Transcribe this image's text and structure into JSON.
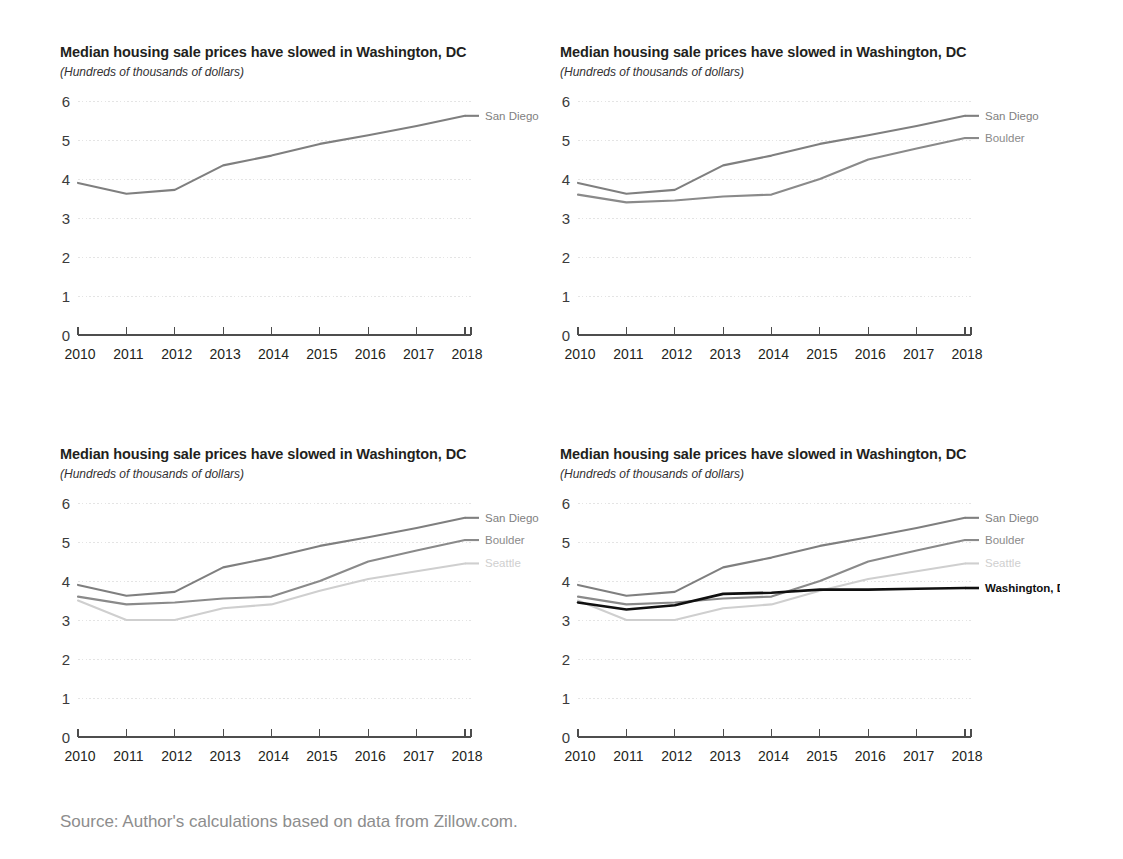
{
  "figure": {
    "source_note": "Source: Author's calculations based on data from Zillow.com."
  },
  "panels": [
    {
      "id": "panel-1",
      "title": "Median housing sale prices have slowed in Washington, DC",
      "subtitle": "(Hundreds of thousands of dollars)",
      "series_shown": [
        "San Diego"
      ]
    },
    {
      "id": "panel-2",
      "title": "Median housing sale prices have slowed in Washington, DC",
      "subtitle": "(Hundreds of thousands of dollars)",
      "series_shown": [
        "San Diego",
        "Boulder"
      ]
    },
    {
      "id": "panel-3",
      "title": "Median housing sale prices have slowed in Washington, DC",
      "subtitle": "(Hundreds of thousands of dollars)",
      "series_shown": [
        "San Diego",
        "Boulder",
        "Seattle"
      ]
    },
    {
      "id": "panel-4",
      "title": "Median housing sale prices have slowed in Washington, DC",
      "subtitle": "(Hundreds of thousands of dollars)",
      "series_shown": [
        "San Diego",
        "Boulder",
        "Seattle",
        "Washington, DC"
      ]
    }
  ],
  "colors": {
    "san_diego": "#7f7f7f",
    "boulder": "#8a8a8a",
    "seattle": "#cfcfcf",
    "washington_dc": "#101010",
    "gridline": "#e4e4e4",
    "axis": "#4d4d4d",
    "source_text": "#8d8d8d"
  },
  "chart_data": [
    {
      "type": "line",
      "title": "Median housing sale prices have slowed in Washington, DC",
      "subtitle": "(Hundreds of thousands of dollars)",
      "xlabel": "",
      "ylabel": "",
      "x": [
        2010,
        2011,
        2012,
        2013,
        2014,
        2015,
        2016,
        2017,
        2018
      ],
      "xtick_labels": [
        "2010",
        "2011",
        "2012",
        "2013",
        "2014",
        "2015",
        "2016",
        "2017",
        "2018"
      ],
      "ytick_labels": [
        "0",
        "1",
        "2",
        "3",
        "4",
        "5",
        "6"
      ],
      "ylim": [
        0,
        6
      ],
      "xlim": [
        2010,
        2018
      ],
      "grid": true,
      "legend_position": "right-end-of-line",
      "series": [
        {
          "name": "San Diego",
          "color": "#7f7f7f",
          "values": [
            3.9,
            3.62,
            3.72,
            4.35,
            4.6,
            4.9,
            5.12,
            5.36,
            5.62
          ]
        }
      ]
    },
    {
      "type": "line",
      "title": "Median housing sale prices have slowed in Washington, DC",
      "subtitle": "(Hundreds of thousands of dollars)",
      "xlabel": "",
      "ylabel": "",
      "x": [
        2010,
        2011,
        2012,
        2013,
        2014,
        2015,
        2016,
        2017,
        2018
      ],
      "xtick_labels": [
        "2010",
        "2011",
        "2012",
        "2013",
        "2014",
        "2015",
        "2016",
        "2017",
        "2018"
      ],
      "ytick_labels": [
        "0",
        "1",
        "2",
        "3",
        "4",
        "5",
        "6"
      ],
      "ylim": [
        0,
        6
      ],
      "xlim": [
        2010,
        2018
      ],
      "grid": true,
      "legend_position": "right-end-of-line",
      "series": [
        {
          "name": "San Diego",
          "color": "#7f7f7f",
          "values": [
            3.9,
            3.62,
            3.72,
            4.35,
            4.6,
            4.9,
            5.12,
            5.36,
            5.62
          ]
        },
        {
          "name": "Boulder",
          "color": "#8a8a8a",
          "values": [
            3.6,
            3.4,
            3.45,
            3.55,
            3.6,
            4.0,
            4.5,
            4.78,
            5.05
          ]
        }
      ]
    },
    {
      "type": "line",
      "title": "Median housing sale prices have slowed in Washington, DC",
      "subtitle": "(Hundreds of thousands of dollars)",
      "xlabel": "",
      "ylabel": "",
      "x": [
        2010,
        2011,
        2012,
        2013,
        2014,
        2015,
        2016,
        2017,
        2018
      ],
      "xtick_labels": [
        "2010",
        "2011",
        "2012",
        "2013",
        "2014",
        "2015",
        "2016",
        "2017",
        "2018"
      ],
      "ytick_labels": [
        "0",
        "1",
        "2",
        "3",
        "4",
        "5",
        "6"
      ],
      "ylim": [
        0,
        6
      ],
      "xlim": [
        2010,
        2018
      ],
      "grid": true,
      "legend_position": "right-end-of-line",
      "series": [
        {
          "name": "San Diego",
          "color": "#7f7f7f",
          "values": [
            3.9,
            3.62,
            3.72,
            4.35,
            4.6,
            4.9,
            5.12,
            5.36,
            5.62
          ]
        },
        {
          "name": "Boulder",
          "color": "#8a8a8a",
          "values": [
            3.6,
            3.4,
            3.45,
            3.55,
            3.6,
            4.0,
            4.5,
            4.78,
            5.05
          ]
        },
        {
          "name": "Seattle",
          "color": "#cfcfcf",
          "values": [
            3.5,
            3.0,
            3.0,
            3.3,
            3.4,
            3.75,
            4.05,
            4.25,
            4.45
          ]
        }
      ]
    },
    {
      "type": "line",
      "title": "Median housing sale prices have slowed in Washington, DC",
      "subtitle": "(Hundreds of thousands of dollars)",
      "xlabel": "",
      "ylabel": "",
      "x": [
        2010,
        2011,
        2012,
        2013,
        2014,
        2015,
        2016,
        2017,
        2018
      ],
      "xtick_labels": [
        "2010",
        "2011",
        "2012",
        "2013",
        "2014",
        "2015",
        "2016",
        "2017",
        "2018"
      ],
      "ytick_labels": [
        "0",
        "1",
        "2",
        "3",
        "4",
        "5",
        "6"
      ],
      "ylim": [
        0,
        6
      ],
      "xlim": [
        2010,
        2018
      ],
      "grid": true,
      "legend_position": "right-end-of-line",
      "series": [
        {
          "name": "San Diego",
          "color": "#7f7f7f",
          "values": [
            3.9,
            3.62,
            3.72,
            4.35,
            4.6,
            4.9,
            5.12,
            5.36,
            5.62
          ]
        },
        {
          "name": "Boulder",
          "color": "#8a8a8a",
          "values": [
            3.6,
            3.4,
            3.45,
            3.55,
            3.6,
            4.0,
            4.5,
            4.78,
            5.05
          ]
        },
        {
          "name": "Seattle",
          "color": "#cfcfcf",
          "values": [
            3.5,
            3.0,
            3.0,
            3.3,
            3.4,
            3.75,
            4.05,
            4.25,
            4.45
          ]
        },
        {
          "name": "Washington, DC",
          "color": "#101010",
          "values": [
            3.45,
            3.27,
            3.38,
            3.67,
            3.7,
            3.78,
            3.78,
            3.8,
            3.82
          ]
        }
      ]
    }
  ]
}
